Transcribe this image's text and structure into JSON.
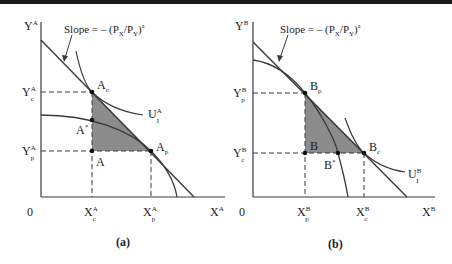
{
  "figure": {
    "colors": {
      "line": "#3a3a3a",
      "shade": "#8c8c8c",
      "text": "#222222",
      "topbar": "#1a1a1a"
    },
    "panels": [
      {
        "id": "a",
        "caption": "(a)",
        "y_axis": "Y",
        "y_axis_sup": "A",
        "x_axis": "X",
        "x_axis_sup": "A",
        "origin": "0",
        "slope_label": "Slope = – (P",
        "slope_x": "X",
        "slope_mid": "/P",
        "slope_y": "Y",
        "slope_end": ")",
        "slope_sup": "a",
        "y_ticks": [
          {
            "main": "Y",
            "sup": "A",
            "sub": "c"
          },
          {
            "main": "Y",
            "sup": "A",
            "sub": "p"
          }
        ],
        "x_ticks": [
          {
            "main": "X",
            "sup": "A",
            "sub": "c"
          },
          {
            "main": "X",
            "sup": "A",
            "sub": "p"
          }
        ],
        "points": [
          {
            "main": "A",
            "sub": "c"
          },
          {
            "main": "A",
            "sup": "*"
          },
          {
            "main": "A"
          },
          {
            "main": "A",
            "sub": "p"
          }
        ],
        "curve_label": {
          "main": "U",
          "sup": "A",
          "sub": "I"
        }
      },
      {
        "id": "b",
        "caption": "(b)",
        "y_axis": "Y",
        "y_axis_sup": "B",
        "x_axis": "X",
        "x_axis_sup": "B",
        "origin": "0",
        "slope_label": "Slope = – (P",
        "slope_x": "X",
        "slope_mid": "/P",
        "slope_y": "Y",
        "slope_end": ")",
        "slope_sup": "a",
        "y_ticks": [
          {
            "main": "Y",
            "sup": "B",
            "sub": "p"
          },
          {
            "main": "Y",
            "sup": "B",
            "sub": "c"
          }
        ],
        "x_ticks": [
          {
            "main": "X",
            "sup": "B",
            "sub": "p"
          },
          {
            "main": "X",
            "sup": "B",
            "sub": "c"
          }
        ],
        "points": [
          {
            "main": "B",
            "sub": "p"
          },
          {
            "main": "B"
          },
          {
            "main": "B",
            "sup": "*"
          },
          {
            "main": "B",
            "sub": "c"
          }
        ],
        "curve_label": {
          "main": "U",
          "sup": "B",
          "sub": "I"
        }
      }
    ]
  }
}
